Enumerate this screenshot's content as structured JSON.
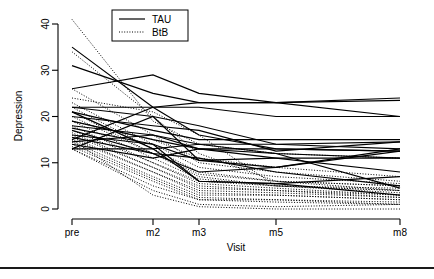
{
  "chart_data": {
    "type": "line",
    "title": "",
    "xlabel": "Visit",
    "ylabel": "Depression",
    "x_categories": [
      "pre",
      "m2",
      "m3",
      "m5",
      "m8"
    ],
    "x_tick_labels": [
      "pre",
      "m2",
      "m3",
      "m5",
      "m8"
    ],
    "y_tick_labels": [
      "0",
      "10",
      "20",
      "30",
      "40"
    ],
    "y_ticks": [
      0,
      10,
      20,
      30,
      40
    ],
    "ylim": [
      0,
      41
    ],
    "grid": false,
    "legend_position": "top-center",
    "legend": [
      {
        "name": "TAU",
        "style": "solid"
      },
      {
        "name": "BtB",
        "style": "dotted"
      }
    ],
    "series": [
      {
        "name": "TAU",
        "style": "solid",
        "values": [
          35,
          22,
          16,
          13,
          12.5
        ]
      },
      {
        "name": "TAU",
        "style": "solid",
        "values": [
          31,
          25,
          23,
          23,
          24
        ]
      },
      {
        "name": "TAU",
        "style": "solid",
        "values": [
          26,
          29,
          25,
          23,
          23.5
        ]
      },
      {
        "name": "TAU",
        "style": "solid",
        "values": [
          22,
          22,
          22,
          20,
          20
        ]
      },
      {
        "name": "TAU",
        "style": "solid",
        "values": [
          22,
          20,
          18,
          14,
          13
        ]
      },
      {
        "name": "TAU",
        "style": "solid",
        "values": [
          21,
          17,
          15,
          15,
          15
        ]
      },
      {
        "name": "TAU",
        "style": "solid",
        "values": [
          21,
          13,
          14,
          12,
          11
        ]
      },
      {
        "name": "TAU",
        "style": "solid",
        "values": [
          20,
          18,
          17,
          12.5,
          14.5
        ]
      },
      {
        "name": "TAU",
        "style": "solid",
        "values": [
          19,
          15,
          13,
          13,
          12.5
        ]
      },
      {
        "name": "TAU",
        "style": "solid",
        "values": [
          18,
          16,
          13,
          11,
          8
        ]
      },
      {
        "name": "TAU",
        "style": "solid",
        "values": [
          17.5,
          14,
          10.5,
          9,
          13
        ]
      },
      {
        "name": "TAU",
        "style": "solid",
        "values": [
          17,
          12,
          8,
          9,
          12.5
        ]
      },
      {
        "name": "TAU",
        "style": "solid",
        "values": [
          16,
          14,
          6,
          5.5,
          7
        ]
      },
      {
        "name": "TAU",
        "style": "solid",
        "values": [
          15.5,
          12,
          11,
          8,
          5
        ]
      },
      {
        "name": "TAU",
        "style": "solid",
        "values": [
          15,
          22,
          23,
          23,
          20
        ]
      },
      {
        "name": "TAU",
        "style": "solid",
        "values": [
          14.5,
          16,
          14,
          14,
          14.5
        ]
      },
      {
        "name": "TAU",
        "style": "solid",
        "values": [
          14,
          11,
          13,
          12,
          4.5
        ]
      },
      {
        "name": "TAU",
        "style": "solid",
        "values": [
          13,
          13,
          6,
          5.5,
          3
        ]
      },
      {
        "name": "TAU",
        "style": "solid",
        "values": [
          13,
          20,
          10.5,
          11,
          11
        ]
      },
      {
        "name": "BtB",
        "style": "dotted",
        "values": [
          41,
          19,
          14,
          12,
          11
        ]
      },
      {
        "name": "BtB",
        "style": "dotted",
        "values": [
          34,
          20,
          12,
          6,
          5
        ]
      },
      {
        "name": "BtB",
        "style": "dotted",
        "values": [
          26,
          16,
          10,
          8,
          6
        ]
      },
      {
        "name": "BtB",
        "style": "dotted",
        "values": [
          23,
          14,
          9,
          7,
          5.5
        ]
      },
      {
        "name": "BtB",
        "style": "dotted",
        "values": [
          22,
          13,
          8,
          6,
          5
        ]
      },
      {
        "name": "BtB",
        "style": "dotted",
        "values": [
          21,
          12,
          7.5,
          6,
          4
        ]
      },
      {
        "name": "BtB",
        "style": "dotted",
        "values": [
          20,
          12,
          7,
          5,
          4
        ]
      },
      {
        "name": "BtB",
        "style": "dotted",
        "values": [
          19,
          11,
          6.5,
          5,
          3.5
        ]
      },
      {
        "name": "BtB",
        "style": "dotted",
        "values": [
          18,
          10,
          6,
          5,
          4.5
        ]
      },
      {
        "name": "BtB",
        "style": "dotted",
        "values": [
          17,
          10,
          5.5,
          4.5,
          3
        ]
      },
      {
        "name": "BtB",
        "style": "dotted",
        "values": [
          16.5,
          9,
          5,
          4,
          3
        ]
      },
      {
        "name": "BtB",
        "style": "dotted",
        "values": [
          16,
          9,
          4.5,
          4,
          2.5
        ]
      },
      {
        "name": "BtB",
        "style": "dotted",
        "values": [
          15.5,
          8,
          4,
          3.5,
          2.5
        ]
      },
      {
        "name": "BtB",
        "style": "dotted",
        "values": [
          15,
          8,
          3.5,
          3,
          2
        ]
      },
      {
        "name": "BtB",
        "style": "dotted",
        "values": [
          14.5,
          7,
          3,
          3,
          2
        ]
      },
      {
        "name": "BtB",
        "style": "dotted",
        "values": [
          14,
          6.5,
          2.5,
          2,
          1.5
        ]
      },
      {
        "name": "BtB",
        "style": "dotted",
        "values": [
          13.5,
          6,
          2,
          2,
          1
        ]
      },
      {
        "name": "BtB",
        "style": "dotted",
        "values": [
          13,
          5,
          2,
          1.5,
          1
        ]
      },
      {
        "name": "BtB",
        "style": "dotted",
        "values": [
          13,
          4,
          1,
          0.5,
          1
        ]
      },
      {
        "name": "BtB",
        "style": "dotted",
        "values": [
          15,
          3,
          0.5,
          0,
          0
        ]
      },
      {
        "name": "BtB",
        "style": "dotted",
        "values": [
          19,
          15,
          11,
          9,
          7
        ]
      },
      {
        "name": "BtB",
        "style": "dotted",
        "values": [
          24,
          21,
          16,
          5,
          4
        ]
      }
    ]
  }
}
